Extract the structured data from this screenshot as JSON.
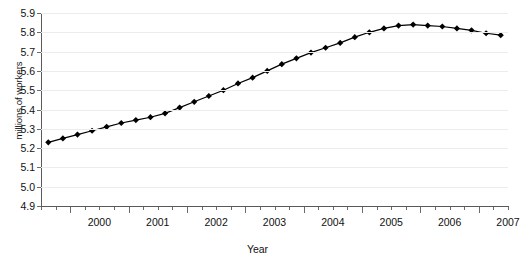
{
  "axes": {
    "ylabel": "millions of workers",
    "xlabel": "Year",
    "yticks": [
      "4.9",
      "5.0",
      "5.1",
      "5.2",
      "5.3",
      "5.4",
      "5.5",
      "5.6",
      "5.7",
      "5.8",
      "5.9"
    ],
    "xticks": [
      "2000",
      "2001",
      "2002",
      "2003",
      "2004",
      "2005",
      "2006",
      "2007"
    ]
  },
  "chart_data": {
    "type": "line",
    "title": "",
    "xlabel": "Year",
    "ylabel": "millions of workers",
    "ylim": [
      4.9,
      5.9
    ],
    "xlim": [
      1999.5,
      2007.5
    ],
    "grid": true,
    "legend": "none",
    "marker": "diamond",
    "line_color": "#000000",
    "marker_color": "#000000",
    "grid_color": "#ececec",
    "x": [
      1999.625,
      1999.875,
      2000.125,
      2000.375,
      2000.625,
      2000.875,
      2001.125,
      2001.375,
      2001.625,
      2001.875,
      2002.125,
      2002.375,
      2002.625,
      2002.875,
      2003.125,
      2003.375,
      2003.625,
      2003.875,
      2004.125,
      2004.375,
      2004.625,
      2004.875,
      2005.125,
      2005.375,
      2005.625,
      2005.875,
      2006.125,
      2006.375,
      2006.625,
      2006.875,
      2007.125,
      2007.375
    ],
    "categories": [
      "1999 Q3",
      "1999 Q4",
      "2000 Q1",
      "2000 Q2",
      "2000 Q3",
      "2000 Q4",
      "2001 Q1",
      "2001 Q2",
      "2001 Q3",
      "2001 Q4",
      "2002 Q1",
      "2002 Q2",
      "2002 Q3",
      "2002 Q4",
      "2003 Q1",
      "2003 Q2",
      "2003 Q3",
      "2003 Q4",
      "2004 Q1",
      "2004 Q2",
      "2004 Q3",
      "2004 Q4",
      "2005 Q1",
      "2005 Q2",
      "2005 Q3",
      "2005 Q4",
      "2006 Q1",
      "2006 Q2",
      "2006 Q3",
      "2006 Q4",
      "2007 Q1",
      "2007 Q2"
    ],
    "values": [
      5.23,
      5.25,
      5.27,
      5.29,
      5.31,
      5.33,
      5.345,
      5.36,
      5.38,
      5.41,
      5.44,
      5.47,
      5.5,
      5.535,
      5.565,
      5.6,
      5.635,
      5.665,
      5.695,
      5.72,
      5.745,
      5.775,
      5.8,
      5.82,
      5.835,
      5.84,
      5.835,
      5.83,
      5.82,
      5.81,
      5.795,
      5.785
    ],
    "values_label_unit": "millions of workers"
  }
}
